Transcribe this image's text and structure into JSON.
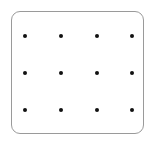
{
  "grid": {
    "rows": 3,
    "cols": 4,
    "dot_color": "#111111",
    "border_color": "#9a9a9a",
    "x_positions": [
      25,
      61,
      97,
      132
    ],
    "y_positions": [
      36,
      73,
      110
    ]
  }
}
